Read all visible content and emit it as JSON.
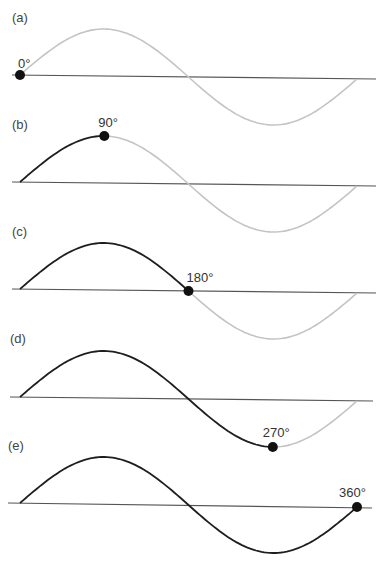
{
  "figure": {
    "colors": {
      "traced": "#1e1e1e",
      "untraced": "#c4c4c4",
      "baseline": "#555555",
      "dot": "#111111"
    },
    "wave": {
      "x_start": 20,
      "x_end": 357,
      "amplitude": 47
    },
    "panels": [
      {
        "id": "a",
        "label": "(a)",
        "angle_label": "0°",
        "angle_deg": 0,
        "baseline_y": 77,
        "label_y": 14
      },
      {
        "id": "b",
        "label": "(b)",
        "angle_label": "90°",
        "angle_deg": 90,
        "baseline_y": 184,
        "label_y": 121
      },
      {
        "id": "c",
        "label": "(c)",
        "angle_label": "180°",
        "angle_deg": 180,
        "baseline_y": 291,
        "label_y": 229
      },
      {
        "id": "d",
        "label": "(d)",
        "angle_label": "270°",
        "angle_deg": 270,
        "baseline_y": 399,
        "label_y": 336
      },
      {
        "id": "e",
        "label": "(e)",
        "angle_label": "360°",
        "angle_deg": 360,
        "baseline_y": 505,
        "label_y": 443
      }
    ]
  }
}
